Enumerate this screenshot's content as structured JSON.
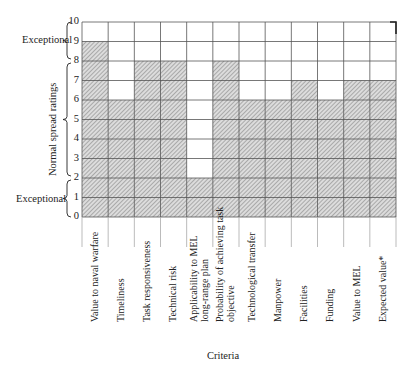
{
  "chart_data": {
    "type": "bar",
    "title": "",
    "xlabel": "Criteria",
    "ylabel": "Normal spread ratings",
    "ylim": [
      0,
      10
    ],
    "yticks": [
      0,
      1,
      2,
      3,
      4,
      5,
      6,
      7,
      8,
      9,
      10
    ],
    "grid": true,
    "categories": [
      "Value to naval warfare",
      "Timeliness",
      "Task responsiveness",
      "Technical risk",
      "Applicability to MEL long-range plan",
      "Probability of achieving task objective",
      "Technological transfer",
      "Manpower",
      "Facilities",
      "Funding",
      "Value to MEL",
      "Expected value*"
    ],
    "category_lines": [
      [
        "Value to naval warfare"
      ],
      [
        "Timeliness"
      ],
      [
        "Task responsiveness"
      ],
      [
        "Technical risk"
      ],
      [
        "Applicability to MEL",
        "long-range plan"
      ],
      [
        "Probability of achieving task",
        "objective"
      ],
      [
        "Technological transfer"
      ],
      [
        "Manpower"
      ],
      [
        "Facilities"
      ],
      [
        "Funding"
      ],
      [
        "Value to MEL"
      ],
      [
        "Expected value*"
      ]
    ],
    "values": [
      9,
      6,
      8,
      8,
      2,
      8,
      6,
      6,
      7,
      6,
      7,
      7
    ],
    "annotations": [
      {
        "text": "Exceptional",
        "range": [
          8,
          10
        ]
      },
      {
        "text": "Normal spread ratings",
        "range": [
          2,
          8
        ]
      },
      {
        "text": "Exceptional",
        "range": [
          0,
          2
        ]
      }
    ]
  },
  "labels": {
    "exceptional_top": "Exceptional",
    "normal": "Normal spread ratings",
    "exceptional_bottom": "Exceptional",
    "criteria": "Criteria"
  },
  "colors": {
    "grid": "#555555",
    "hatch": "#777777",
    "fill": "#dcdcdc"
  }
}
